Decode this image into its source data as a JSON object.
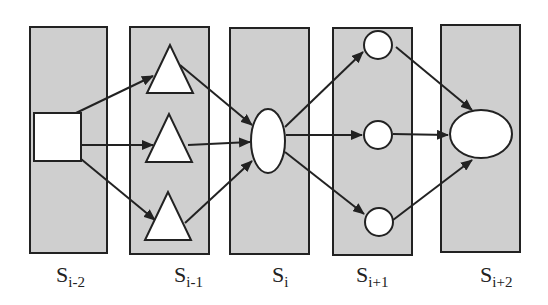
{
  "diagram": {
    "type": "layered-state-graph",
    "colors": {
      "stage_fill": "#cfcfcf",
      "stroke": "#222222",
      "node_fill": "#ffffff",
      "background": "#ffffff"
    },
    "stages": [
      {
        "id": "s_im2",
        "base": "S",
        "sub": "i-2",
        "x": 30,
        "y": 27,
        "w": 77,
        "h": 226
      },
      {
        "id": "s_im1",
        "base": "S",
        "sub": "i-1",
        "x": 130,
        "y": 27,
        "w": 79,
        "h": 227
      },
      {
        "id": "s_i",
        "base": "S",
        "sub": "i",
        "x": 230,
        "y": 28,
        "w": 79,
        "h": 226
      },
      {
        "id": "s_ip1",
        "base": "S",
        "sub": "i+1",
        "x": 333,
        "y": 28,
        "w": 79,
        "h": 227
      },
      {
        "id": "s_ip2",
        "base": "S",
        "sub": "i+2",
        "x": 441,
        "y": 25,
        "w": 79,
        "h": 227
      }
    ],
    "nodes": [
      {
        "id": "square",
        "shape": "square",
        "stage": "s_im2"
      },
      {
        "id": "tri_top",
        "shape": "triangle",
        "stage": "s_im1"
      },
      {
        "id": "tri_mid",
        "shape": "triangle",
        "stage": "s_im1"
      },
      {
        "id": "tri_bot",
        "shape": "triangle",
        "stage": "s_im1"
      },
      {
        "id": "ellipse_i",
        "shape": "ellipse",
        "stage": "s_i"
      },
      {
        "id": "circ_top",
        "shape": "circle",
        "stage": "s_ip1"
      },
      {
        "id": "circ_mid",
        "shape": "circle",
        "stage": "s_ip1"
      },
      {
        "id": "circ_bot",
        "shape": "circle",
        "stage": "s_ip1"
      },
      {
        "id": "ellipse_ip2",
        "shape": "ellipse",
        "stage": "s_ip2"
      }
    ],
    "edges": [
      {
        "from": "square",
        "to": "tri_top"
      },
      {
        "from": "square",
        "to": "tri_mid"
      },
      {
        "from": "square",
        "to": "tri_bot"
      },
      {
        "from": "tri_top",
        "to": "ellipse_i"
      },
      {
        "from": "tri_mid",
        "to": "ellipse_i"
      },
      {
        "from": "tri_bot",
        "to": "ellipse_i"
      },
      {
        "from": "ellipse_i",
        "to": "circ_top"
      },
      {
        "from": "ellipse_i",
        "to": "circ_mid"
      },
      {
        "from": "ellipse_i",
        "to": "circ_bot"
      },
      {
        "from": "circ_top",
        "to": "ellipse_ip2"
      },
      {
        "from": "circ_mid",
        "to": "ellipse_ip2"
      },
      {
        "from": "circ_bot",
        "to": "ellipse_ip2"
      }
    ],
    "labels": {
      "s_im2": {
        "base": "S",
        "sub": "i-2"
      },
      "s_im1": {
        "base": "S",
        "sub": "i-1"
      },
      "s_i": {
        "base": "S",
        "sub": "i"
      },
      "s_ip1": {
        "base": "S",
        "sub": "i+1"
      },
      "s_ip2": {
        "base": "S",
        "sub": "i+2"
      }
    }
  }
}
